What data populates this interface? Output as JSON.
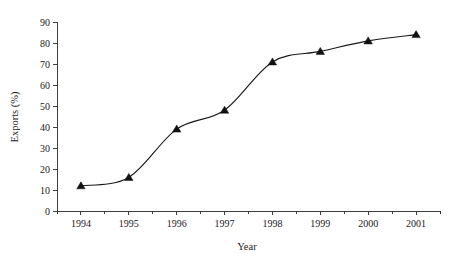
{
  "chart_data": {
    "type": "line",
    "title": "",
    "subtitle": "",
    "xlabel": "Year",
    "ylabel": "Exports (%)",
    "categories": [
      "1994",
      "1995",
      "1996",
      "1997",
      "1998",
      "1999",
      "2000",
      "2001"
    ],
    "x": [
      1994,
      1995,
      1996,
      1997,
      1998,
      1999,
      2000,
      2001
    ],
    "values": [
      12,
      16,
      39,
      48,
      71,
      76,
      81,
      84
    ],
    "series": [
      {
        "name": "Exports",
        "values": [
          12,
          16,
          39,
          48,
          71,
          76,
          81,
          84
        ],
        "marker": "triangle-up",
        "marker_color": "#111111",
        "line_color": "#1a1a1a",
        "line_style": "smooth"
      }
    ],
    "xlim": [
      1993.5,
      2001.5
    ],
    "ylim": [
      0,
      90
    ],
    "ytick_values": [
      0,
      10,
      20,
      30,
      40,
      50,
      60,
      70,
      80,
      90
    ],
    "ytick_labels": [
      "0",
      "10",
      "20",
      "30",
      "40",
      "50",
      "60",
      "70",
      "80",
      "90"
    ],
    "xtick_labels": [
      "1994",
      "1995",
      "1996",
      "1997",
      "1998",
      "1999",
      "2000",
      "2001"
    ],
    "minor_xticks": true,
    "grid": false,
    "legend": null,
    "legend_position": "none",
    "annotations": []
  },
  "axes": {
    "y_title": "Exports (%)",
    "x_title": "Year"
  },
  "colors": {
    "background": "#ffffff",
    "axis": "#2b2b2b",
    "line": "#1a1a1a",
    "marker": "#111111",
    "text": "#1a1a1a"
  }
}
